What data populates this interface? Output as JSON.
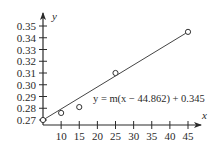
{
  "chart_data": {
    "type": "scatter",
    "title": "",
    "xlabel": "x",
    "ylabel": "y",
    "x_ticks": [
      10,
      15,
      20,
      25,
      30,
      35,
      40,
      45
    ],
    "y_ticks": [
      0.27,
      0.28,
      0.29,
      0.3,
      0.31,
      0.32,
      0.33,
      0.34,
      0.35
    ],
    "y_tick_labels": [
      "0.27",
      "0.28",
      "0.29",
      "0.30",
      "0.31",
      "0.32",
      "0.33",
      "0.34",
      "0.35"
    ],
    "xlim": [
      5,
      48
    ],
    "ylim": [
      0.267,
      0.358
    ],
    "grid": false,
    "series": [
      {
        "name": "data points",
        "marker": "open-circle",
        "x": [
          5,
          10,
          15,
          25,
          45
        ],
        "y": [
          0.27,
          0.276,
          0.281,
          0.31,
          0.345
        ]
      },
      {
        "name": "fitted line",
        "type": "line",
        "x": [
          5,
          45
        ],
        "y": [
          0.27,
          0.345
        ]
      }
    ],
    "annotations": [
      {
        "text": "y = m(x − 44.862) + 0.345",
        "x": 27,
        "y": 0.296
      }
    ]
  },
  "labels": {
    "x_axis": "x",
    "y_axis": "y",
    "equation": "y = m(x − 44.862) + 0.345"
  }
}
